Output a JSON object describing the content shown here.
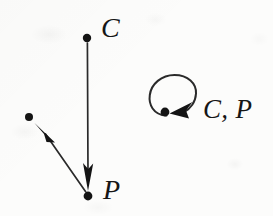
{
  "figure": {
    "type": "state-transition-diagram",
    "background_color": "#fcfcfb",
    "ink_color": "#161616",
    "labels": {
      "top_node": "C",
      "bottom_node": "P",
      "self_loop_node": "C, P"
    }
  },
  "diagram_data": {
    "nodes": [
      {
        "id": "n_top",
        "label": "C",
        "x": 87,
        "y": 38,
        "radius": 4.2
      },
      {
        "id": "n_bottom",
        "label": "P",
        "x": 88,
        "y": 196,
        "radius": 4.4
      },
      {
        "id": "n_left",
        "label": "",
        "x": 29,
        "y": 117,
        "radius": 4.0
      },
      {
        "id": "n_loop",
        "label": "C, P",
        "x": 165,
        "y": 112,
        "radius": 4.4
      }
    ],
    "edges": [
      {
        "from": "n_top",
        "to": "n_bottom",
        "kind": "straight-arrow",
        "direction": "down"
      },
      {
        "from": "n_bottom",
        "to": "n_left",
        "kind": "straight-arrow",
        "direction": "up-left"
      },
      {
        "from": "n_loop",
        "to": "n_loop",
        "kind": "self-loop",
        "direction": "counter-clockwise"
      }
    ],
    "label_positions": [
      {
        "text": "C",
        "x": 101,
        "y": 14
      },
      {
        "text": "P",
        "x": 103,
        "y": 176
      },
      {
        "text": "C, P",
        "x": 203,
        "y": 96
      }
    ]
  }
}
